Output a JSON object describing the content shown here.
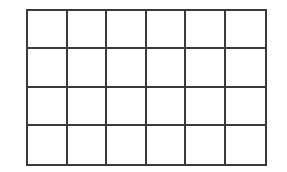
{
  "diagram": {
    "type": "grid",
    "rows": 4,
    "columns": 6,
    "line_color": "#3a3a3a",
    "background_color": "#ffffff",
    "cells_filled": false
  }
}
